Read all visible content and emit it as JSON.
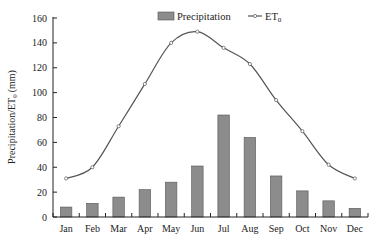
{
  "chart_data": {
    "type": "bar+line",
    "title": "",
    "xlabel": "",
    "ylabel": "Precipitation/ET",
    "ylabel_sub": "0",
    "ylabel_unit": "(mm)",
    "ylim": [
      0,
      160
    ],
    "yticks": [
      0,
      20,
      40,
      60,
      80,
      100,
      120,
      140,
      160
    ],
    "categories": [
      "Jan",
      "Feb",
      "Mar",
      "Apr",
      "May",
      "Jun",
      "Jul",
      "Aug",
      "Sep",
      "Oct",
      "Nov",
      "Dec"
    ],
    "grid": false,
    "legend_position": "top-right",
    "series": [
      {
        "name": "Precipitation",
        "type": "bar",
        "color": "#8c8c8c",
        "values": [
          8,
          11,
          16,
          22,
          28,
          41,
          82,
          64,
          33,
          21,
          13,
          7
        ]
      },
      {
        "name": "ET",
        "name_sub": "0",
        "type": "line",
        "color": "#555555",
        "values": [
          31,
          40,
          73,
          107,
          140,
          149,
          136,
          123,
          94,
          69,
          42,
          31
        ]
      }
    ]
  },
  "legend": {
    "precipitation_label": "Precipitation",
    "et_label": "ET",
    "et_sub": "0"
  }
}
